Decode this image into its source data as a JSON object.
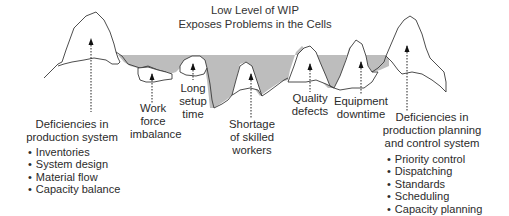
{
  "title": {
    "line1": "Low Level of WIP",
    "line2": "Exposes Problems in the Cells"
  },
  "problems": [
    {
      "id": "work-force",
      "line1": "Work",
      "line2": "force",
      "line3": "imbalance"
    },
    {
      "id": "setup-time",
      "line1": "Long",
      "line2": "setup",
      "line3": "time"
    },
    {
      "id": "skilled-workers",
      "line1": "Shortage",
      "line2": "of skilled",
      "line3": "workers"
    },
    {
      "id": "quality",
      "line1": "Quality",
      "line2": "defects"
    },
    {
      "id": "equipment",
      "line1": "Equipment",
      "line2": "downtime"
    }
  ],
  "left_group": {
    "line1": "Deficiencies in",
    "line2": "production system",
    "items": [
      "Inventories",
      "System design",
      "Material flow",
      "Capacity balance"
    ]
  },
  "right_group": {
    "line1": "Deficiencies in",
    "line2": "production planning",
    "line3": "and control system",
    "items": [
      "Priority control",
      "Dispatching",
      "Standards",
      "Scheduling",
      "Capacity planning"
    ]
  },
  "colors": {
    "water": "#bdbdbd",
    "outline": "#3a3a3a"
  }
}
